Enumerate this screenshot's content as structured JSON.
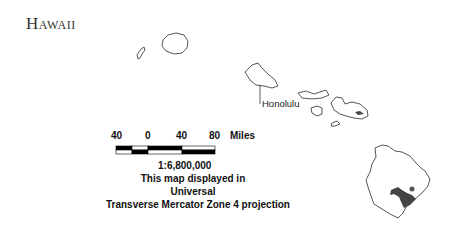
{
  "map": {
    "title": "Hawaii",
    "place_labels": [
      {
        "name": "Honolulu"
      }
    ],
    "scale_bar": {
      "ticks": [
        "40",
        "0",
        "40",
        "80"
      ],
      "unit": "Miles",
      "ratio": "1:6,800,000"
    },
    "projection_note": {
      "line1": "This map displayed in Universal",
      "line2": "Transverse Mercator Zone 4 projection"
    },
    "colors": {
      "coastline": "#555555",
      "land": "#ffffff",
      "relief_dark": "#444444"
    }
  }
}
